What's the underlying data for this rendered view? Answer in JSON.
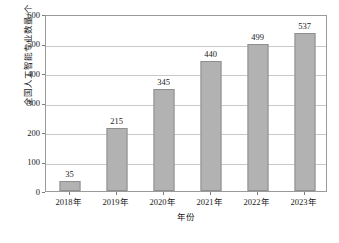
{
  "chart_data": {
    "type": "bar",
    "title": "",
    "xlabel": "年份",
    "ylabel": "全国人工智能专业数量/个",
    "categories": [
      "2018年",
      "2019年",
      "2020年",
      "2021年",
      "2022年",
      "2023年"
    ],
    "values": [
      35,
      215,
      345,
      440,
      499,
      537
    ],
    "value_labels": [
      "35",
      "215",
      "345",
      "440",
      "499",
      "537"
    ],
    "ylim": [
      0,
      600
    ],
    "ytick_labels": [
      "0",
      "100",
      "200",
      "300",
      "400",
      "500",
      "600"
    ],
    "ytick_values": [
      0,
      100,
      200,
      300,
      400,
      500,
      600
    ],
    "grid": true,
    "grid_axis": "y",
    "legend": false,
    "legend_position": "none",
    "bar_color": "#b2b2b2",
    "bar_border_color": "#8f8f8f",
    "grid_color": "#c9c9c9",
    "frame_color": "#9a9a9a",
    "background_color": "#ffffff",
    "text_color": "#1a1a1a"
  }
}
